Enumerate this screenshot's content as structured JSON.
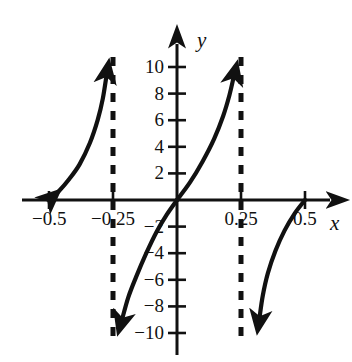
{
  "chart_data": {
    "type": "line",
    "title": "",
    "xlabel": "x",
    "ylabel": "y",
    "xlim": [
      -0.58,
      0.58
    ],
    "ylim": [
      -11.5,
      11.5
    ],
    "grid": false,
    "legend": null,
    "x_ticks": [
      {
        "value": -0.5,
        "label": "−0.5"
      },
      {
        "value": -0.25,
        "label": "−0.25"
      },
      {
        "value": 0.25,
        "label": "0.25"
      },
      {
        "value": 0.5,
        "label": "0.5"
      }
    ],
    "y_ticks": [
      {
        "value": 10,
        "label": "10"
      },
      {
        "value": 8,
        "label": "8"
      },
      {
        "value": 6,
        "label": "6"
      },
      {
        "value": 4,
        "label": "4"
      },
      {
        "value": 2,
        "label": "2"
      },
      {
        "value": -2,
        "label": "−2"
      },
      {
        "value": -4,
        "label": "−4"
      },
      {
        "value": -6,
        "label": "−6"
      },
      {
        "value": -8,
        "label": "−8"
      },
      {
        "value": -10,
        "label": "−10"
      }
    ],
    "asymptotes": [
      {
        "type": "vertical",
        "x": -0.25,
        "style": "dashed"
      },
      {
        "type": "vertical",
        "x": 0.25,
        "style": "dashed"
      }
    ],
    "zeros": [
      -0.5,
      0,
      0.5
    ],
    "series": [
      {
        "name": "branch-left",
        "arrow_start": true,
        "arrow_end": true,
        "points": [
          {
            "x": -0.5,
            "y": 0
          },
          {
            "x": -0.46,
            "y": 0.7
          },
          {
            "x": -0.42,
            "y": 1.6
          },
          {
            "x": -0.38,
            "y": 2.7
          },
          {
            "x": -0.34,
            "y": 4.3
          },
          {
            "x": -0.31,
            "y": 6.0
          },
          {
            "x": -0.29,
            "y": 7.6
          },
          {
            "x": -0.275,
            "y": 9.4
          }
        ]
      },
      {
        "name": "branch-mid-lower",
        "arrow_start": false,
        "arrow_end": true,
        "points": [
          {
            "x": 0,
            "y": 0
          },
          {
            "x": -0.04,
            "y": -1.1
          },
          {
            "x": -0.08,
            "y": -2.4
          },
          {
            "x": -0.12,
            "y": -4.0
          },
          {
            "x": -0.16,
            "y": -5.8
          },
          {
            "x": -0.19,
            "y": -7.3
          },
          {
            "x": -0.215,
            "y": -9.0
          }
        ]
      },
      {
        "name": "branch-mid-upper",
        "arrow_start": false,
        "arrow_end": true,
        "points": [
          {
            "x": 0,
            "y": 0
          },
          {
            "x": 0.05,
            "y": 1.3
          },
          {
            "x": 0.1,
            "y": 2.9
          },
          {
            "x": 0.145,
            "y": 4.6
          },
          {
            "x": 0.18,
            "y": 6.3
          },
          {
            "x": 0.205,
            "y": 7.9
          },
          {
            "x": 0.222,
            "y": 9.3
          }
        ]
      },
      {
        "name": "branch-right",
        "arrow_start": false,
        "arrow_end": true,
        "points": [
          {
            "x": 0.5,
            "y": 0
          },
          {
            "x": 0.46,
            "y": -1.0
          },
          {
            "x": 0.42,
            "y": -2.3
          },
          {
            "x": 0.385,
            "y": -3.8
          },
          {
            "x": 0.355,
            "y": -5.5
          },
          {
            "x": 0.335,
            "y": -7.2
          },
          {
            "x": 0.322,
            "y": -8.9
          }
        ]
      }
    ],
    "colors": {
      "curve": "#111111",
      "axis": "#111111",
      "asymptote": "#111111",
      "background": "#ffffff"
    }
  },
  "axis_labels": {
    "x": "x",
    "y": "y"
  }
}
